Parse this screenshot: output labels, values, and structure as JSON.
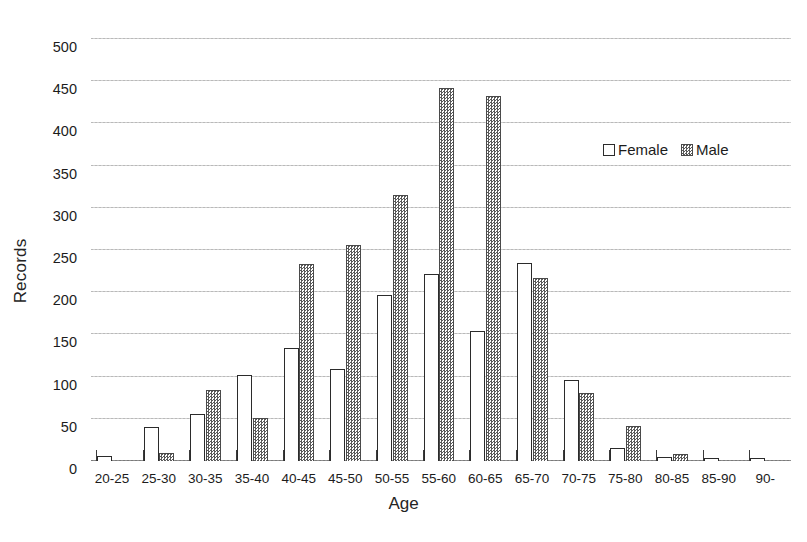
{
  "chart_data": {
    "type": "bar",
    "title": "",
    "xlabel": "Age",
    "ylabel": "Records",
    "categories": [
      "20-25",
      "25-30",
      "30-35",
      "35-40",
      "40-45",
      "45-50",
      "50-55",
      "55-60",
      "60-65",
      "65-70",
      "70-75",
      "75-80",
      "80-85",
      "85-90",
      "90-"
    ],
    "series": [
      {
        "name": "Female",
        "values": [
          6,
          40,
          56,
          102,
          134,
          109,
          197,
          221,
          154,
          235,
          96,
          15,
          5,
          4,
          4
        ]
      },
      {
        "name": "Male",
        "values": [
          0,
          9,
          84,
          51,
          233,
          256,
          315,
          442,
          433,
          217,
          80,
          41,
          8,
          0,
          0
        ]
      }
    ],
    "ylim": [
      0,
      500
    ],
    "yticks": [
      0,
      50,
      100,
      150,
      200,
      250,
      300,
      350,
      400,
      450,
      500
    ],
    "ytick_labels": [
      "0",
      "50",
      "100",
      "150",
      "200",
      "250",
      "300",
      "350",
      "400",
      "450",
      "500"
    ],
    "grid": true,
    "legend_position": "upper right",
    "legend_entries": [
      "Female",
      "Male"
    ],
    "colors": {
      "female_fill": "#ffffff",
      "female_edge": "#2b2b2b",
      "male_pattern": "#5a5a5a",
      "male_edge": "#4a4a4a",
      "gridline": "#b9b9b9",
      "axis": "#3a3a3a",
      "text": "#1c1c1c",
      "background": "#ffffff"
    }
  }
}
